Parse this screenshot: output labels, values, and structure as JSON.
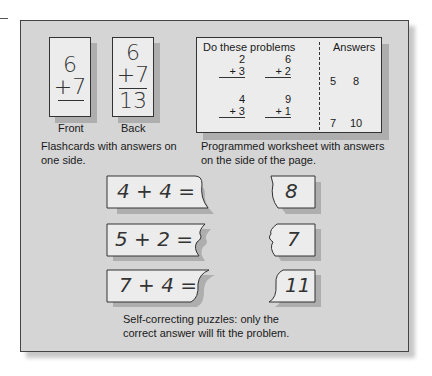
{
  "flashcards": {
    "front": {
      "top": "6",
      "bottom": "+7",
      "label": "Front"
    },
    "back": {
      "top": "6",
      "bottom": "+7",
      "answer": "13",
      "label": "Back"
    },
    "caption_line1": "Flashcards with answers on",
    "caption_line2": "one side."
  },
  "worksheet": {
    "header_problems": "Do these problems",
    "header_answers": "Answers",
    "problems": [
      {
        "top": "2",
        "bottom": "+ 3"
      },
      {
        "top": "6",
        "bottom": "+ 2"
      },
      {
        "top": "4",
        "bottom": "+ 3"
      },
      {
        "top": "9",
        "bottom": "+ 1"
      }
    ],
    "answers": [
      "5",
      "8",
      "7",
      "10"
    ],
    "caption_line1": "Programmed worksheet with answers",
    "caption_line2": "on the side of the page."
  },
  "puzzles": {
    "items": [
      {
        "problem": "4 + 4 =",
        "answer": "8"
      },
      {
        "problem": "5 + 2 =",
        "answer": "7"
      },
      {
        "problem": "7 + 4 =",
        "answer": "11"
      }
    ],
    "caption_line1": "Self-correcting puzzles: only the",
    "caption_line2": "correct answer will fit the problem."
  }
}
